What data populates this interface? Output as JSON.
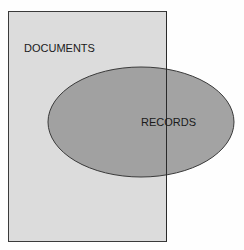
{
  "diagram": {
    "type": "venn",
    "shapes": [
      {
        "id": "documents",
        "shape": "rectangle",
        "label": "DOCUMENTS",
        "fill": "#dcdcdc"
      },
      {
        "id": "records",
        "shape": "ellipse",
        "label": "RECORDS",
        "fill": "#9a9a9a"
      }
    ],
    "relation": "RECORDS partially overlaps DOCUMENTS"
  }
}
